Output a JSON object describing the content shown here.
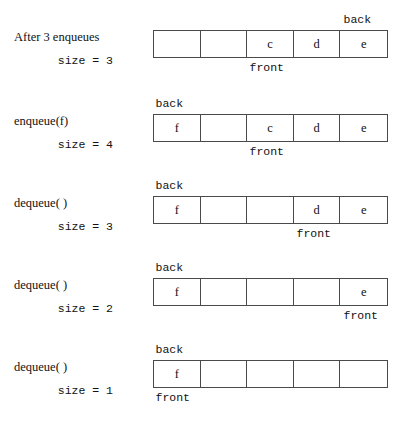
{
  "diagram": {
    "cell_count": 5,
    "geometry": {
      "queue_left": 153,
      "queue_width": 235,
      "cell_width": 47,
      "row_tops": [
        30,
        114,
        196,
        278,
        360
      ]
    },
    "pointer_names": {
      "back": "back",
      "front": "front"
    },
    "rows": [
      {
        "operation": "After 3 enqueues",
        "size_text": "size = 3",
        "size_value": 3,
        "cells": [
          "",
          "",
          "c",
          "d",
          "e"
        ],
        "back_index": 4,
        "front_index": 2,
        "back_label": "back",
        "front_label": "front"
      },
      {
        "operation": "enqueue(f)",
        "size_text": "size = 4",
        "size_value": 4,
        "cells": [
          "f",
          "",
          "c",
          "d",
          "e"
        ],
        "back_index": 0,
        "front_index": 2,
        "back_label": "back",
        "front_label": "front"
      },
      {
        "operation": "dequeue( )",
        "size_text": "size = 3",
        "size_value": 3,
        "cells": [
          "f",
          "",
          "",
          "d",
          "e"
        ],
        "back_index": 0,
        "front_index": 3,
        "back_label": "back",
        "front_label": "front"
      },
      {
        "operation": "dequeue( )",
        "size_text": "size = 2",
        "size_value": 2,
        "cells": [
          "f",
          "",
          "",
          "",
          "e"
        ],
        "back_index": 0,
        "front_index": 4,
        "back_label": "back",
        "front_label": "front"
      },
      {
        "operation": "dequeue( )",
        "size_text": "size = 1",
        "size_value": 1,
        "cells": [
          "f",
          "",
          "",
          "",
          ""
        ],
        "back_index": 0,
        "front_index": 0,
        "back_label": "back",
        "front_label": "front"
      }
    ]
  }
}
